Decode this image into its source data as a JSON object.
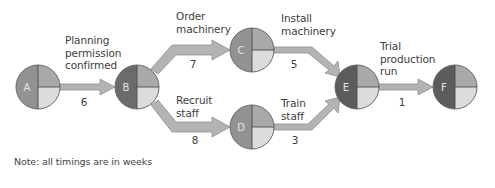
{
  "diagram": {
    "colors": {
      "arrow_fill": "#b3b3b3",
      "arrow_stroke": "#8f8f8f",
      "node_outline": "#6a6a6a",
      "node_divider": "#4a4a4a",
      "quarter_top_right": "#a9a9a9",
      "quarter_bottom_right_light": "#dcdcdc",
      "left_light": "#929292",
      "left_dark": "#6b6b6b",
      "left_darker": "#5c5c5c"
    },
    "nodes": [
      {
        "id": "A",
        "label": "A",
        "cx": 38,
        "cy": 87,
        "shade": "light"
      },
      {
        "id": "B",
        "label": "B",
        "cx": 137,
        "cy": 87,
        "shade": "dark"
      },
      {
        "id": "C",
        "label": "C",
        "cx": 252,
        "cy": 50,
        "shade": "light"
      },
      {
        "id": "D",
        "label": "D",
        "cx": 252,
        "cy": 127,
        "shade": "light"
      },
      {
        "id": "E",
        "label": "E",
        "cx": 357,
        "cy": 87,
        "shade": "darker"
      },
      {
        "id": "F",
        "label": "F",
        "cx": 455,
        "cy": 87,
        "shade": "darker"
      }
    ],
    "activities": [
      {
        "from": "A",
        "to": "B",
        "label": "Planning\npermission\nconfirmed",
        "duration": "6"
      },
      {
        "from": "B",
        "to": "C",
        "label": "Order\nmachinery",
        "duration": "7"
      },
      {
        "from": "B",
        "to": "D",
        "label": "Recruit\nstaff",
        "duration": "8"
      },
      {
        "from": "C",
        "to": "E",
        "label": "Install\nmachinery",
        "duration": "5"
      },
      {
        "from": "D",
        "to": "E",
        "label": "Train\nstaff",
        "duration": "3"
      },
      {
        "from": "E",
        "to": "F",
        "label": "Trial\nproduction\nrun",
        "duration": "1"
      }
    ],
    "note": "Note: all timings are in weeks"
  }
}
